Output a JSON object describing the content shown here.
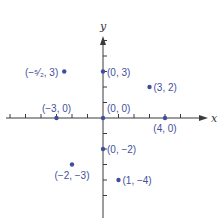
{
  "chart_data": {
    "type": "scatter",
    "title": "",
    "xlabel": "x",
    "ylabel": "y",
    "xlim": [
      -6,
      6
    ],
    "ylim": [
      -5,
      6
    ],
    "grid": false,
    "point_color": "#3f4fa0",
    "axis_color": "#3a3a3a",
    "x_ticks": [
      -6,
      -5,
      -4,
      -3,
      -2,
      -1,
      1,
      2,
      3,
      4,
      5
    ],
    "y_ticks": [
      -5,
      -4,
      -3,
      -2,
      -1,
      1,
      2,
      3,
      4,
      5
    ],
    "points": [
      {
        "x": -2.5,
        "y": 3,
        "label": "(−⁵⁄₂, 3)",
        "label_pos": "left"
      },
      {
        "x": 0,
        "y": 3,
        "label": "(0, 3)",
        "label_pos": "right"
      },
      {
        "x": 3,
        "y": 2,
        "label": "(3, 2)",
        "label_pos": "right"
      },
      {
        "x": -3,
        "y": 0,
        "label": "(−3, 0)",
        "label_pos": "above"
      },
      {
        "x": 0,
        "y": 0,
        "label": "(0, 0)",
        "label_pos": "above-right"
      },
      {
        "x": 4,
        "y": 0,
        "label": "(4, 0)",
        "label_pos": "below"
      },
      {
        "x": 0,
        "y": -2,
        "label": "(0, −2)",
        "label_pos": "right"
      },
      {
        "x": -2,
        "y": -3,
        "label": "(−2, −3)",
        "label_pos": "below"
      },
      {
        "x": 1,
        "y": -4,
        "label": "(1, −4)",
        "label_pos": "right"
      }
    ]
  }
}
